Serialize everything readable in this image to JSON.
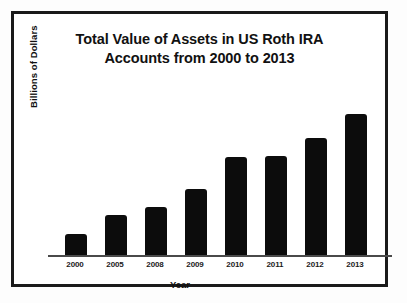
{
  "figure": {
    "frame_color": "#1a1a1a",
    "background": "#ffffff"
  },
  "chart_data": {
    "type": "bar",
    "title": "Total Value of Assets in US Roth IRA Accounts from 2000 to 2013",
    "title_line_1": "Total Value of Assets in US Roth IRA",
    "title_line_2": "Accounts from 2000 to 2013",
    "xlabel": "Year",
    "ylabel": "Billions of Dollars",
    "categories": [
      "2000",
      "2005",
      "2008",
      "2009",
      "2010",
      "2011",
      "2012",
      "2013"
    ],
    "values": [
      78,
      146,
      174,
      238,
      352,
      356,
      420,
      505
    ],
    "bar_pixel_heights": [
      22,
      41,
      49,
      67,
      99,
      100,
      118,
      142
    ],
    "ylim": [
      0,
      570
    ],
    "grid": false,
    "legend": false,
    "axis_ticks_y": false,
    "bar_color": "#0c0c0c",
    "baseline_color": "#4a4a4a"
  }
}
